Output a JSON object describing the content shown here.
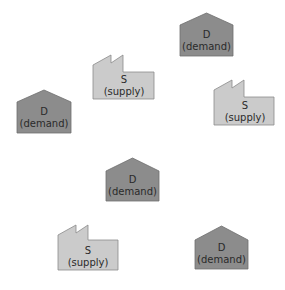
{
  "diagram": {
    "colors": {
      "demand_fill": "#8c8c8c",
      "supply_fill": "#cbcbcb",
      "text": "#2a2a2a"
    },
    "nodes": [
      {
        "id": "d1",
        "type": "demand",
        "symbol": "D",
        "label": "(demand)",
        "x": 180,
        "y": 13,
        "w": 53,
        "h": 43
      },
      {
        "id": "s1",
        "type": "supply",
        "symbol": "S",
        "label": "(supply)",
        "x": 93,
        "y": 55,
        "w": 61,
        "h": 44
      },
      {
        "id": "d2",
        "type": "demand",
        "symbol": "D",
        "label": "(demand)",
        "x": 17,
        "y": 90,
        "w": 54,
        "h": 43
      },
      {
        "id": "s2",
        "type": "supply",
        "symbol": "S",
        "label": "(supply)",
        "x": 214,
        "y": 80,
        "w": 60,
        "h": 45
      },
      {
        "id": "d3",
        "type": "demand",
        "symbol": "D",
        "label": "(demand)",
        "x": 106,
        "y": 158,
        "w": 53,
        "h": 43
      },
      {
        "id": "s3",
        "type": "supply",
        "symbol": "S",
        "label": "(supply)",
        "x": 58,
        "y": 225,
        "w": 60,
        "h": 45
      },
      {
        "id": "d4",
        "type": "demand",
        "symbol": "D",
        "label": "(demand)",
        "x": 195,
        "y": 226,
        "w": 53,
        "h": 43
      }
    ]
  }
}
